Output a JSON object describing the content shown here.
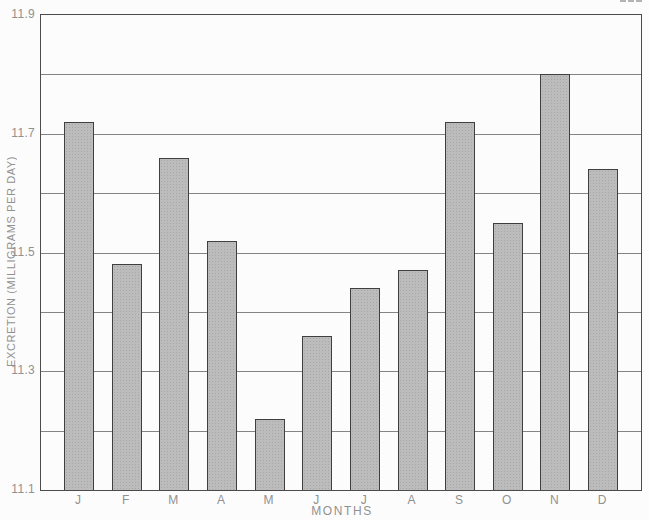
{
  "figure": {
    "background": "#fcfcfc"
  },
  "chart_data": {
    "type": "bar",
    "title": "",
    "categories": [
      "J",
      "F",
      "M",
      "A",
      "M",
      "J",
      "J",
      "A",
      "S",
      "O",
      "N",
      "D"
    ],
    "values": [
      11.72,
      11.48,
      11.66,
      11.52,
      11.22,
      11.36,
      11.44,
      11.47,
      11.72,
      11.55,
      11.8,
      11.64
    ],
    "xlabel": "MONTHS",
    "ylabel": "EXCRETION (MILLIGRAMS PER DAY)",
    "ylim": [
      11.1,
      11.9
    ],
    "ytick_values": [
      11.9,
      11.7,
      11.5,
      11.3,
      11.1
    ],
    "ytick_labels": [
      "11.9",
      "11.7",
      "11.5",
      "11.3",
      "11.1"
    ],
    "grid_values": [
      11.2,
      11.3,
      11.4,
      11.5,
      11.6,
      11.7,
      11.8
    ],
    "grid": true,
    "legend_position": "none",
    "colors": {
      "bar_fill": "#bcbcbc",
      "bar_border": "#3f3f3f",
      "grid_line": "#6f6f6f",
      "frame": "#4c4c4c",
      "label_text": "#919191"
    }
  }
}
